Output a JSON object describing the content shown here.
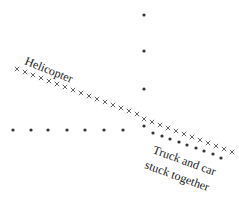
{
  "diagram": {
    "labels": {
      "helicopter": "Helicopter",
      "truck_line1": "Truck and car",
      "truck_line2": "stuck together"
    },
    "colors": {
      "dot": "#333333",
      "cross": "#555555",
      "text": "#1a1a1a",
      "background": "#ffffff"
    },
    "car_path_dots": [
      [
        144,
        15
      ],
      [
        144,
        51
      ],
      [
        144,
        89
      ]
    ],
    "truck_path_dots": [
      [
        13,
        130
      ],
      [
        31,
        130
      ],
      [
        48,
        130
      ],
      [
        67,
        130
      ],
      [
        85,
        130
      ],
      [
        104,
        130
      ],
      [
        123,
        130
      ]
    ],
    "collision_point": [
      144,
      126
    ],
    "combined_dots": [
      [
        144,
        126
      ],
      [
        153,
        133
      ],
      [
        162,
        136
      ],
      [
        170,
        139
      ],
      [
        179,
        142
      ],
      [
        187,
        145
      ],
      [
        196,
        148
      ],
      [
        204,
        151
      ],
      [
        213,
        154
      ],
      [
        221,
        158
      ]
    ],
    "helicopter_crosses": [
      [
        17,
        69
      ],
      [
        25,
        72
      ],
      [
        33,
        75
      ],
      [
        41,
        78
      ],
      [
        49,
        81
      ],
      [
        57,
        84
      ],
      [
        65,
        87
      ],
      [
        73,
        90
      ],
      [
        81,
        93
      ],
      [
        89,
        96
      ],
      [
        97,
        99
      ],
      [
        105,
        102
      ],
      [
        113,
        105
      ],
      [
        121,
        108
      ],
      [
        129,
        111
      ],
      [
        137,
        114
      ],
      [
        144,
        119
      ],
      [
        152,
        122
      ],
      [
        160,
        125
      ],
      [
        168,
        128
      ],
      [
        176,
        131
      ],
      [
        184,
        134
      ],
      [
        192,
        137
      ],
      [
        200,
        140
      ],
      [
        208,
        143
      ],
      [
        216,
        146
      ],
      [
        224,
        149
      ],
      [
        232,
        152
      ]
    ]
  }
}
